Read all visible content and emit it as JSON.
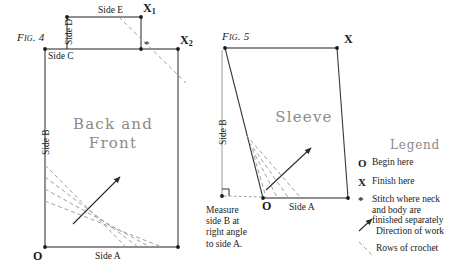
{
  "figures": {
    "fig4": {
      "tag": "Fig. 4",
      "piece_name_line1": "Back and",
      "piece_name_line2": "Front",
      "labels": {
        "side_a": "Side A",
        "side_b": "Side B",
        "side_c": "Side C",
        "side_d": "Side D",
        "side_e": "Side E",
        "origin": "O",
        "x1": "X",
        "x1_sub": "1",
        "x2": "X",
        "x2_sub": "2",
        "star": "*"
      }
    },
    "fig5": {
      "tag": "Fig. 5",
      "piece_name": "Sleeve",
      "labels": {
        "side_a": "Side A",
        "side_b": "Side B",
        "origin": "O",
        "x": "X"
      },
      "note_lines": [
        "Measure",
        "side B at",
        "right angle",
        "to side A."
      ]
    }
  },
  "legend": {
    "title": "Legend",
    "items": [
      {
        "symbol": "O",
        "text_lines": [
          "Begin here"
        ]
      },
      {
        "symbol": "X",
        "text_lines": [
          "Finish here"
        ]
      },
      {
        "symbol": "*",
        "text_lines": [
          "Stitch where neck",
          "and body are",
          "finished separately"
        ]
      },
      {
        "symbol": "arrow-icon",
        "text_lines": [
          "Direction of work"
        ]
      },
      {
        "symbol": "dashed-line-icon",
        "text_lines": [
          "Rows of crochet"
        ]
      }
    ]
  },
  "colors": {
    "ink": "#1a1a1a",
    "outline": "#3a3a3a",
    "thin_rule": "#9a9a9a",
    "dashed": "#9aa0a8",
    "faded_text": "#8a8a8a",
    "paper": "#ffffff"
  }
}
